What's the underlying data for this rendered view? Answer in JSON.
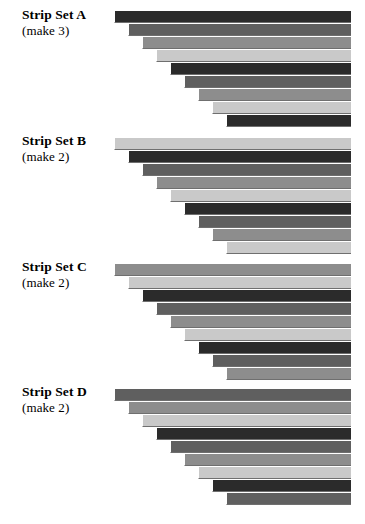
{
  "page": {
    "background_color": "#ffffff"
  },
  "palette": {
    "dark": "#2b2b2b",
    "medium_dark": "#5f5f5f",
    "medium": "#8d8d8d",
    "light": "#c9c9c9",
    "shadow_edge": "#6f6f6f",
    "highlight_edge": "#ffffff",
    "text": "#000000"
  },
  "layout": {
    "strip_height_px": 13,
    "strip_indent_px": 14,
    "right_margin_px": 14,
    "strips_per_set": 9
  },
  "strip_sets": [
    {
      "id": "a",
      "title": "Strip Set A",
      "quantity_label": "(make 3)",
      "quantity": 3,
      "top_px": 10,
      "label_top_px": 8,
      "strips": [
        {
          "index": 1,
          "tone": "dark",
          "color": "#2b2b2b"
        },
        {
          "index": 2,
          "tone": "medium_dark",
          "color": "#5f5f5f"
        },
        {
          "index": 3,
          "tone": "medium",
          "color": "#8d8d8d"
        },
        {
          "index": 4,
          "tone": "light",
          "color": "#c9c9c9"
        },
        {
          "index": 5,
          "tone": "dark",
          "color": "#2b2b2b"
        },
        {
          "index": 6,
          "tone": "medium_dark",
          "color": "#5f5f5f"
        },
        {
          "index": 7,
          "tone": "medium",
          "color": "#8d8d8d"
        },
        {
          "index": 8,
          "tone": "light",
          "color": "#c9c9c9"
        },
        {
          "index": 9,
          "tone": "dark",
          "color": "#2b2b2b"
        }
      ]
    },
    {
      "id": "b",
      "title": "Strip Set B",
      "quantity_label": "(make 2)",
      "quantity": 2,
      "top_px": 137,
      "label_top_px": 134,
      "strips": [
        {
          "index": 1,
          "tone": "light",
          "color": "#c9c9c9"
        },
        {
          "index": 2,
          "tone": "dark",
          "color": "#2b2b2b"
        },
        {
          "index": 3,
          "tone": "medium_dark",
          "color": "#5f5f5f"
        },
        {
          "index": 4,
          "tone": "medium",
          "color": "#8d8d8d"
        },
        {
          "index": 5,
          "tone": "light",
          "color": "#c9c9c9"
        },
        {
          "index": 6,
          "tone": "dark",
          "color": "#2b2b2b"
        },
        {
          "index": 7,
          "tone": "medium_dark",
          "color": "#5f5f5f"
        },
        {
          "index": 8,
          "tone": "medium",
          "color": "#8d8d8d"
        },
        {
          "index": 9,
          "tone": "light",
          "color": "#c9c9c9"
        }
      ]
    },
    {
      "id": "c",
      "title": "Strip Set C",
      "quantity_label": "(make 2)",
      "quantity": 2,
      "top_px": 263,
      "label_top_px": 260,
      "strips": [
        {
          "index": 1,
          "tone": "medium",
          "color": "#8d8d8d"
        },
        {
          "index": 2,
          "tone": "light",
          "color": "#c9c9c9"
        },
        {
          "index": 3,
          "tone": "dark",
          "color": "#2b2b2b"
        },
        {
          "index": 4,
          "tone": "medium_dark",
          "color": "#5f5f5f"
        },
        {
          "index": 5,
          "tone": "medium",
          "color": "#8d8d8d"
        },
        {
          "index": 6,
          "tone": "light",
          "color": "#c9c9c9"
        },
        {
          "index": 7,
          "tone": "dark",
          "color": "#2b2b2b"
        },
        {
          "index": 8,
          "tone": "medium_dark",
          "color": "#5f5f5f"
        },
        {
          "index": 9,
          "tone": "medium",
          "color": "#8d8d8d"
        }
      ]
    },
    {
      "id": "d",
      "title": "Strip Set D",
      "quantity_label": "(make 2)",
      "quantity": 2,
      "top_px": 388,
      "label_top_px": 385,
      "strips": [
        {
          "index": 1,
          "tone": "medium_dark",
          "color": "#5f5f5f"
        },
        {
          "index": 2,
          "tone": "medium",
          "color": "#8d8d8d"
        },
        {
          "index": 3,
          "tone": "light",
          "color": "#c9c9c9"
        },
        {
          "index": 4,
          "tone": "dark",
          "color": "#2b2b2b"
        },
        {
          "index": 5,
          "tone": "medium_dark",
          "color": "#5f5f5f"
        },
        {
          "index": 6,
          "tone": "medium",
          "color": "#8d8d8d"
        },
        {
          "index": 7,
          "tone": "light",
          "color": "#c9c9c9"
        },
        {
          "index": 8,
          "tone": "dark",
          "color": "#2b2b2b"
        },
        {
          "index": 9,
          "tone": "medium_dark",
          "color": "#5f5f5f"
        }
      ]
    }
  ]
}
